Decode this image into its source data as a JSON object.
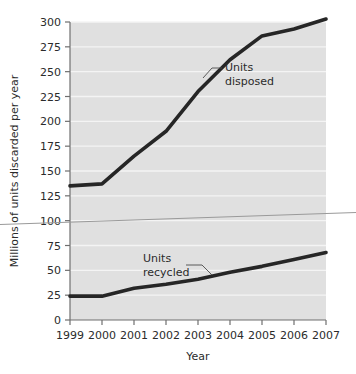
{
  "chart_data": {
    "type": "line",
    "title": "",
    "subtitle": "",
    "xlabel": "Year",
    "ylabel": "Millions of units discarded per year",
    "categories": [
      "1999",
      "2000",
      "2001",
      "2002",
      "2003",
      "2004",
      "2005",
      "2006",
      "2007"
    ],
    "x": [
      1999,
      2000,
      2001,
      2002,
      2003,
      2004,
      2005,
      2006,
      2007
    ],
    "xlim": [
      1999,
      2007
    ],
    "ylim": [
      0,
      300
    ],
    "yticks": [
      0,
      25,
      50,
      75,
      100,
      125,
      150,
      175,
      200,
      225,
      250,
      275,
      300
    ],
    "ytick_labels": [
      "0",
      "25",
      "50",
      "75",
      "100",
      "125",
      "150",
      "175",
      "200",
      "225",
      "250",
      "275",
      "300"
    ],
    "xtick_labels": [
      "1999",
      "2000",
      "2001",
      "2002",
      "2003",
      "2004",
      "2005",
      "2006",
      "2007"
    ],
    "grid": "horizontal-white-gridlines",
    "legend": "none-inline-annotations",
    "plot_background": "#e0e0e0",
    "gridline_color": "#f2f2f2",
    "series": [
      {
        "name": "Units disposed",
        "color": "#262626",
        "values": [
          135,
          137,
          165,
          190,
          230,
          262,
          286,
          293,
          303
        ]
      },
      {
        "name": "Units recycled",
        "color": "#262626",
        "values": [
          24,
          24,
          32,
          36,
          41,
          48,
          54,
          61,
          68
        ]
      }
    ],
    "annotations": [
      {
        "id": "disposed",
        "text_line1": "Units",
        "text_line2": "disposed"
      },
      {
        "id": "recycled",
        "text_line1": "Units",
        "text_line2": "recycled"
      }
    ],
    "artifact_line": {
      "description": "thin gray scan artifact crossing full image width",
      "color": "#9a9a9a"
    }
  }
}
